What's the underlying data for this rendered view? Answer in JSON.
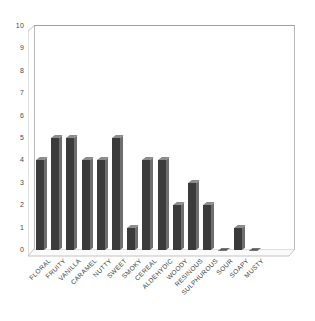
{
  "chart_data": {
    "type": "bar",
    "title": "",
    "subtitle": "",
    "xlabel": "",
    "ylabel": "",
    "ylim": [
      0,
      10
    ],
    "ytick_step": 1,
    "yticks": [
      10,
      9,
      8,
      7,
      6,
      5,
      4,
      3,
      2,
      1,
      0
    ],
    "grid": false,
    "legend": false,
    "legend_position": "none",
    "style": "3d-column",
    "bar_color": "#3b3b3b",
    "bar_side_color": "#6e6e6e",
    "bar_top_color": "#8c8c8c",
    "background_color": "#ffffff",
    "frame_color": "#b9b9b9",
    "label_rotation_deg": -45,
    "categories": [
      "FLORAL",
      "FRUITY",
      "VANILLA",
      "CARAMEL",
      "NUTTY",
      "SWEET",
      "SMOKY",
      "CEREAL",
      "ALDEHYDIC",
      "WOODY",
      "RESINOUS",
      "SULPHUROUS",
      "SOUR",
      "SOAPY",
      "MUSTY"
    ],
    "values": [
      4,
      5,
      5,
      4,
      4,
      5,
      1,
      4,
      4,
      2,
      3,
      2,
      0,
      1,
      0
    ]
  }
}
